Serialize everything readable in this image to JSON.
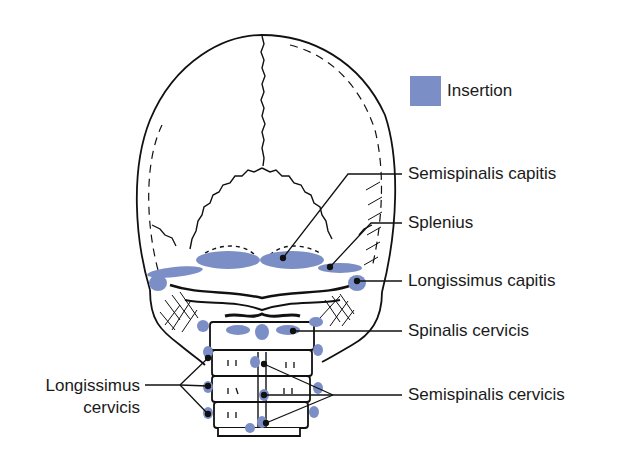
{
  "figure": {
    "colors": {
      "insertion": "#7b8fc6",
      "outline": "#111111",
      "background": "#ffffff"
    }
  },
  "legend": {
    "items": [
      {
        "swatch_color": "#7b8fc6",
        "label": "Insertion"
      }
    ]
  },
  "labels": {
    "right": [
      {
        "text": "Semispinalis capitis"
      },
      {
        "text": "Splenius"
      },
      {
        "text": "Longissimus capitis"
      },
      {
        "text": "Spinalis cervicis"
      },
      {
        "text": "Semispinalis cervicis"
      }
    ],
    "left": [
      {
        "line1": "Longissimus",
        "line2": "cervicis"
      }
    ]
  }
}
